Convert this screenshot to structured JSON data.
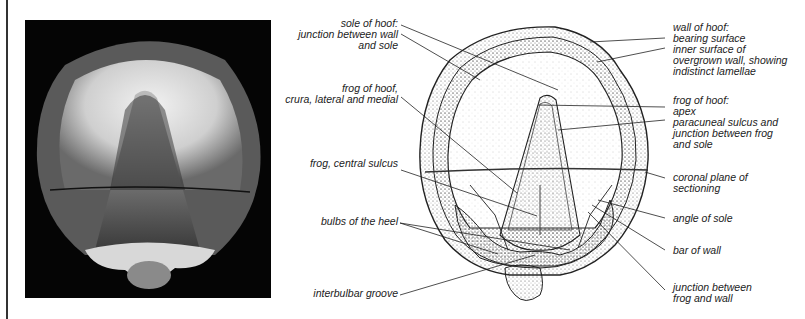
{
  "figure": {
    "photo_alt": "Photograph of equine hoof, solar (ground) surface view",
    "left_labels": [
      {
        "id": "sole",
        "text": "sole of hoof:\njunction between wall\nand sole"
      },
      {
        "id": "frog-crura",
        "text": "frog of hoof,\ncrura, lateral and medial"
      },
      {
        "id": "frog-central-sulcus",
        "text": "frog, central sulcus"
      },
      {
        "id": "bulbs",
        "text": "bulbs of the heel"
      },
      {
        "id": "interbulbar",
        "text": "interbulbar groove"
      }
    ],
    "right_labels": [
      {
        "id": "wall",
        "text": "wall of hoof:\nbearing surface\ninner surface of\novergrown wall, showing\nindistinct lamellae"
      },
      {
        "id": "frog-apex",
        "text": "frog of hoof:\napex\nparacuneal sulcus and\njunction between frog\nand sole"
      },
      {
        "id": "coronal",
        "text": "coronal plane of\nsectioning"
      },
      {
        "id": "angle-sole",
        "text": "angle of sole"
      },
      {
        "id": "bar-wall",
        "text": "bar of wall"
      },
      {
        "id": "junction-frog-wall",
        "text": "junction between\nfrog and wall"
      }
    ]
  },
  "colors": {
    "ink": "#222222",
    "photo_bg": "#050505",
    "stipple": "#555555"
  }
}
